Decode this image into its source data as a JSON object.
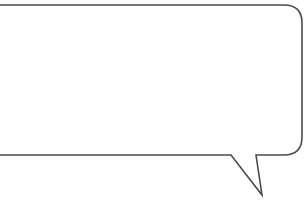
{
  "speech_bubble": {
    "text": "",
    "stroke_color": "#4a4a4a",
    "fill_color": "#ffffff"
  }
}
